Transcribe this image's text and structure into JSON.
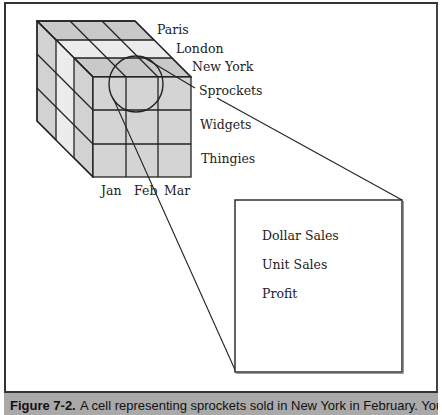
{
  "diagram": {
    "type": "olap-cube",
    "depth_labels": [
      "Paris",
      "London",
      "New York"
    ],
    "row_labels": [
      "Sprockets",
      "Widgets",
      "Thingies"
    ],
    "column_labels": [
      "Jan",
      "Feb",
      "Mar"
    ],
    "highlighted_cell": {
      "city": "New York",
      "product": "Sprockets",
      "month": "Feb"
    },
    "callout_measures": [
      "Dollar Sales",
      "Unit Sales",
      "Profit"
    ],
    "colors": {
      "cube_face": "#d4d4d4",
      "cube_light_slice": "#ececec",
      "cube_top": "#c8c8c8",
      "line": "#222222",
      "caption_bar": "#a9a9a9"
    }
  },
  "caption": {
    "figure_number": "Figure 7-2.",
    "text": "A cell representing sprockets sold in New York in February. You can"
  }
}
